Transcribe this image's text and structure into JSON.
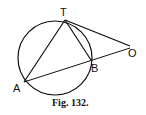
{
  "figure": {
    "caption": "Fig. 132.",
    "points": {
      "T": {
        "label": "T",
        "x": 65,
        "y": 19
      },
      "A": {
        "label": "A",
        "x": 24,
        "y": 82
      },
      "B": {
        "label": "B",
        "x": 91,
        "y": 60
      },
      "O": {
        "label": "O",
        "x": 131,
        "y": 46
      }
    },
    "circle": {
      "cx": 55,
      "cy": 59,
      "r": 37
    },
    "segments": [
      "TA",
      "TB",
      "TO",
      "AO"
    ]
  }
}
